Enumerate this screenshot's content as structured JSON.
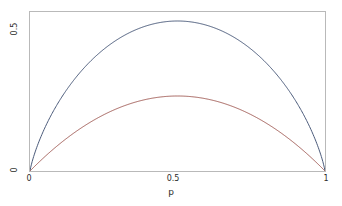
{
  "figure": {
    "background_color": "#ffffff",
    "frame_color": "#b9b9b9",
    "text_color": "#2b2b2b"
  },
  "axes": {
    "x": {
      "title": "p",
      "ticks": [
        {
          "value": 0,
          "label": "0"
        },
        {
          "value": 0.5,
          "label": "0.5"
        },
        {
          "value": 1,
          "label": "1"
        }
      ],
      "range": [
        0,
        1
      ]
    },
    "y": {
      "title": "",
      "ticks": [
        {
          "value": 0,
          "label": "0"
        },
        {
          "value": 0.5,
          "label": "0.5"
        }
      ],
      "range": [
        0,
        0.53
      ]
    }
  },
  "chart_data": {
    "type": "line",
    "title": "",
    "subtitle": "",
    "xlabel": "p",
    "ylabel": "",
    "xlim": [
      0,
      1
    ],
    "ylim": [
      0,
      0.53
    ],
    "grid": false,
    "legend": "none",
    "xticks": [
      0,
      0.5,
      1
    ],
    "xticklabels": [
      "0",
      "0.5",
      "1"
    ],
    "yticks": [
      0,
      0.5
    ],
    "yticklabels": [
      "0",
      "0.5"
    ],
    "x": [
      0,
      0.025,
      0.05,
      0.075,
      0.1,
      0.125,
      0.15,
      0.175,
      0.2,
      0.225,
      0.25,
      0.275,
      0.3,
      0.325,
      0.35,
      0.375,
      0.4,
      0.425,
      0.45,
      0.475,
      0.5,
      0.525,
      0.55,
      0.575,
      0.6,
      0.625,
      0.65,
      0.675,
      0.7,
      0.725,
      0.75,
      0.775,
      0.8,
      0.825,
      0.85,
      0.875,
      0.9,
      0.925,
      0.95,
      0.975,
      1
    ],
    "series": [
      {
        "name": "entropy-curve",
        "color": "#4a5a7a",
        "description": "scaled binary entropy, peaks at (0.5, 0.5)",
        "values": [
          0,
          0.0849,
          0.1431,
          0.1907,
          0.2323,
          0.2695,
          0.3034,
          0.3347,
          0.3638,
          0.391,
          0.4165,
          0.4405,
          0.4632,
          0.4845,
          0.5046,
          0.5236,
          0.5414,
          0.5581,
          0.5738,
          0.5884,
          0.5,
          0.5884,
          0.5738,
          0.5581,
          0.5414,
          0.5236,
          0.5046,
          0.4845,
          0.4632,
          0.4405,
          0.4165,
          0.391,
          0.3638,
          0.3347,
          0.3034,
          0.2695,
          0.2323,
          0.1907,
          0.1431,
          0.0849,
          0
        ]
      },
      {
        "name": "gini-parabola",
        "color": "#a4605a",
        "description": "2p(1-p), peaks at (0.5, 0.5)",
        "values": [
          0,
          0.04875,
          0.095,
          0.13875,
          0.18,
          0.21875,
          0.255,
          0.28875,
          0.32,
          0.34875,
          0.375,
          0.39875,
          0.42,
          0.43875,
          0.455,
          0.46875,
          0.48,
          0.48875,
          0.495,
          0.49875,
          0.5,
          0.49875,
          0.495,
          0.48875,
          0.48,
          0.46875,
          0.455,
          0.43875,
          0.42,
          0.39875,
          0.375,
          0.34875,
          0.32,
          0.28875,
          0.255,
          0.21875,
          0.18,
          0.13875,
          0.095,
          0.04875,
          0
        ]
      }
    ]
  }
}
